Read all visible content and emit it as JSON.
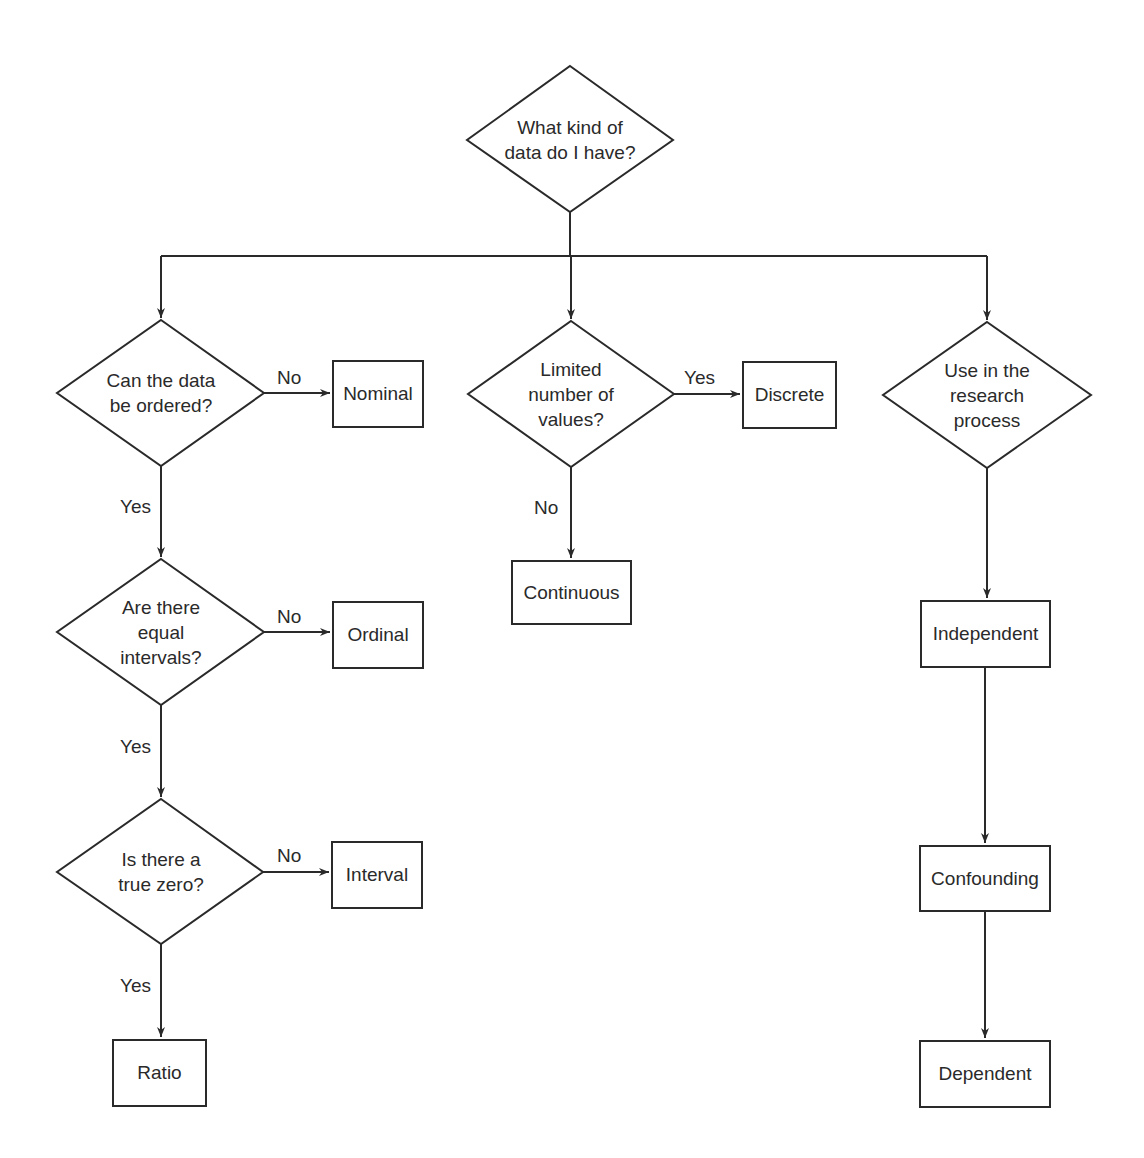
{
  "diagram": {
    "type": "flowchart",
    "root": {
      "id": "root",
      "label": "What kind of\ndata do I have?"
    },
    "decisions": {
      "ordered": "Can the data\nbe ordered?",
      "equal_intervals": "Are there\nequal\nintervals?",
      "true_zero": "Is there a\ntrue zero?",
      "limited_values": "Limited\nnumber of\nvalues?",
      "research_use": "Use in the\nresearch\nprocess"
    },
    "outcomes": {
      "nominal": "Nominal",
      "ordinal": "Ordinal",
      "interval": "Interval",
      "ratio": "Ratio",
      "discrete": "Discrete",
      "continuous": "Continuous",
      "independent": "Independent",
      "confounding": "Confounding",
      "dependent": "Dependent"
    },
    "edge_labels": {
      "ordered_no": "No",
      "ordered_yes": "Yes",
      "equal_no": "No",
      "equal_yes": "Yes",
      "zero_no": "No",
      "zero_yes": "Yes",
      "limited_yes": "Yes",
      "limited_no": "No"
    },
    "edges": [
      {
        "from": "root",
        "to": "ordered"
      },
      {
        "from": "root",
        "to": "limited_values"
      },
      {
        "from": "root",
        "to": "research_use"
      },
      {
        "from": "ordered",
        "to": "nominal",
        "label": "No"
      },
      {
        "from": "ordered",
        "to": "equal_intervals",
        "label": "Yes"
      },
      {
        "from": "equal_intervals",
        "to": "ordinal",
        "label": "No"
      },
      {
        "from": "equal_intervals",
        "to": "true_zero",
        "label": "Yes"
      },
      {
        "from": "true_zero",
        "to": "interval",
        "label": "No"
      },
      {
        "from": "true_zero",
        "to": "ratio",
        "label": "Yes"
      },
      {
        "from": "limited_values",
        "to": "discrete",
        "label": "Yes"
      },
      {
        "from": "limited_values",
        "to": "continuous",
        "label": "No"
      },
      {
        "from": "research_use",
        "to": "independent"
      },
      {
        "from": "independent",
        "to": "confounding"
      },
      {
        "from": "confounding",
        "to": "dependent"
      }
    ],
    "colors": {
      "stroke": "#2a2a2a",
      "text": "#2a2a2a",
      "background": "#ffffff"
    }
  }
}
